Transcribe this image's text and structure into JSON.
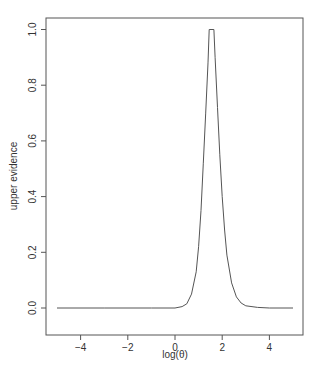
{
  "chart_data": {
    "type": "line",
    "title": "",
    "xlabel": "log(θ)",
    "ylabel": "upper evidence",
    "xlim": [
      -5.4,
      5.4
    ],
    "ylim": [
      -0.04,
      1.04
    ],
    "xticks": [
      -4,
      -2,
      0,
      2,
      4
    ],
    "xtick_labels": [
      "−4",
      "−2",
      "0",
      "2",
      "4"
    ],
    "yticks": [
      0.0,
      0.2,
      0.4,
      0.6,
      0.8,
      1.0
    ],
    "ytick_labels": [
      "0.0",
      "0.2",
      "0.4",
      "0.6",
      "0.8",
      "1.0"
    ],
    "grid": false,
    "legend": null,
    "series": [
      {
        "name": "upper evidence",
        "color": "#555555",
        "x": [
          -5.0,
          -3.0,
          -1.0,
          0.0,
          0.3,
          0.5,
          0.7,
          0.9,
          1.0,
          1.1,
          1.2,
          1.3,
          1.4,
          1.45,
          1.65,
          1.7,
          1.8,
          1.9,
          2.0,
          2.1,
          2.2,
          2.4,
          2.6,
          2.8,
          3.0,
          3.5,
          4.0,
          5.0
        ],
        "y": [
          0.0,
          0.0,
          0.0,
          0.0,
          0.005,
          0.015,
          0.05,
          0.13,
          0.22,
          0.35,
          0.52,
          0.7,
          0.88,
          1.0,
          1.0,
          0.9,
          0.72,
          0.55,
          0.4,
          0.28,
          0.19,
          0.09,
          0.04,
          0.018,
          0.008,
          0.002,
          0.0,
          0.0
        ]
      }
    ]
  },
  "colors": {
    "axis": "#555555",
    "line": "#555555",
    "text": "#333333",
    "background": "#ffffff"
  }
}
